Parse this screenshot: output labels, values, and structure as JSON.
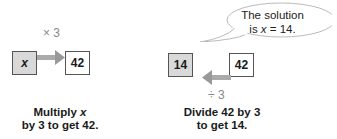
{
  "left": {
    "operator": "× 3",
    "variable_box": "x",
    "result_box": "42",
    "caption_line1": "Multiply x",
    "caption_line2": "by 3 to get 42."
  },
  "right": {
    "bubble_line1": "The solution",
    "bubble_line2": "is x = 14.",
    "solution_box": "14",
    "start_box": "42",
    "operator": "÷ 3",
    "caption_line1": "Divide 42 by 3",
    "caption_line2": "to get 14."
  },
  "colors": {
    "shaded_box": "#d9d9d9",
    "arrow": "#999999"
  }
}
